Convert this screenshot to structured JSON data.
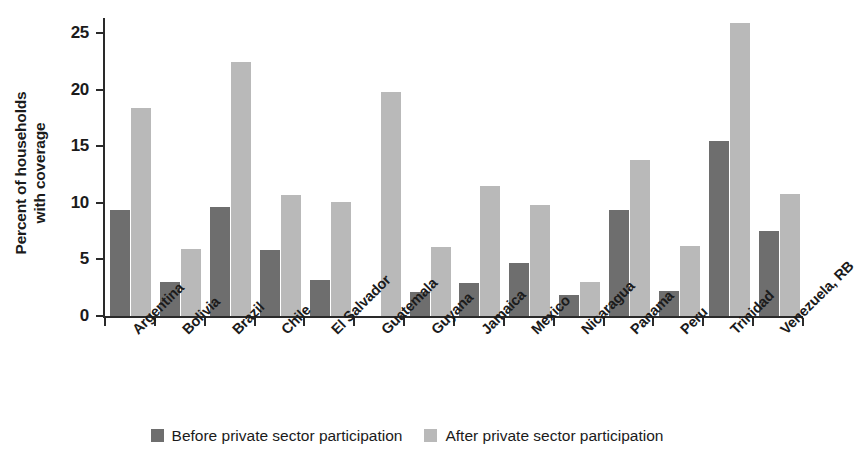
{
  "chart_data": {
    "type": "bar",
    "title": "",
    "subtitle": "",
    "xlabel": "",
    "ylabel": "Percent of households with coverage",
    "ylabel_lines": [
      "Percent of households",
      "with coverage"
    ],
    "ylim": [
      0,
      26.5
    ],
    "yticks": [
      0,
      5,
      10,
      15,
      20,
      25
    ],
    "ytick_labels": [
      "0",
      "5",
      "10",
      "15",
      "20",
      "25"
    ],
    "grid": false,
    "legend_position": "bottom-center",
    "categories": [
      "Argentina",
      "Bolivia",
      "Brazil",
      "Chile",
      "El Salvador",
      "Guatemala",
      "Guyana",
      "Jamaica",
      "Mexico",
      "Nicaragua",
      "Panama",
      "Peru",
      "Trinidad",
      "Venezuela, RB"
    ],
    "series": [
      {
        "name": "Before private sector participation",
        "color": "#6e6e6e",
        "values": [
          9.4,
          3.0,
          9.6,
          5.8,
          3.2,
          null,
          2.1,
          2.9,
          4.7,
          1.9,
          9.4,
          2.2,
          15.5,
          7.5
        ]
      },
      {
        "name": "After private sector participation",
        "color": "#b9b9b9",
        "values": [
          18.4,
          5.9,
          22.4,
          10.7,
          10.1,
          19.8,
          6.1,
          11.5,
          9.8,
          3.0,
          13.8,
          6.2,
          25.9,
          10.8
        ]
      }
    ]
  },
  "legend": {
    "entries": [
      {
        "label": "Before private sector participation",
        "color": "#6e6e6e"
      },
      {
        "label": "After private sector participation",
        "color": "#b9b9b9"
      }
    ]
  },
  "colors": {
    "before": "#6e6e6e",
    "after": "#b9b9b9",
    "axis": "#2a2a2a",
    "text": "#1b1b1b",
    "background": "#ffffff"
  }
}
